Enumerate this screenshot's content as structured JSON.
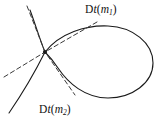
{
  "figure": {
    "type": "nodal-cubic-tangent-diagram",
    "background_color": "#ffffff",
    "stroke_color": "#1a1a1a",
    "dash_color": "#3a3a3a",
    "width": 160,
    "height": 124,
    "node_point": {
      "x": 45,
      "y": 52,
      "label": "self-intersection node"
    },
    "labels": {
      "tangent_upper": {
        "prefix": "D",
        "operator": "t",
        "open_paren": "(",
        "argument": "m",
        "subscript": "1",
        "close_paren": ")",
        "full_text": "Dt(m1)",
        "x": 85,
        "y": 4
      },
      "tangent_lower": {
        "prefix": "D",
        "operator": "t",
        "open_paren": "(",
        "argument": "m",
        "subscript": "2",
        "close_paren": ")",
        "full_text": "Dt(m2)",
        "x": 39,
        "y": 104
      }
    },
    "curve": {
      "name": "nodal cubic with loop",
      "loop_bounds": {
        "left": 45,
        "right": 153,
        "top": 26,
        "bottom": 98
      },
      "branch_upper_left_end": {
        "x": 30,
        "y": 10
      },
      "branch_lower_left_end": {
        "x": 9,
        "y": 113
      }
    },
    "tangent_lines": [
      {
        "name": "tangent-upper-branch",
        "style": "dashed",
        "from": {
          "x": 28,
          "y": 7
        },
        "to": {
          "x": 96,
          "y": 22
        },
        "label_ref": "tangent_upper"
      },
      {
        "name": "tangent-lower-branch",
        "style": "dashed",
        "from": {
          "x": 5,
          "y": 78
        },
        "to": {
          "x": 78,
          "y": 93
        },
        "label_ref": "tangent_lower"
      }
    ]
  }
}
